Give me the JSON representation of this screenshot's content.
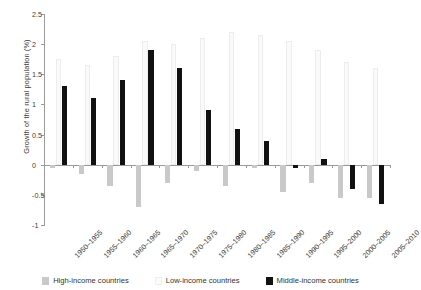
{
  "chart_data": {
    "type": "bar",
    "title": "",
    "xlabel": "",
    "ylabel": "Growth of the rural population (%)",
    "ylim": [
      -1,
      2.5
    ],
    "yticks": [
      -1,
      -0.5,
      0,
      0.5,
      1,
      1.5,
      2,
      2.5
    ],
    "ytick_labels": [
      "-1",
      "-0.5",
      "0",
      "0.5",
      "1",
      "1.5",
      "2",
      "2.5"
    ],
    "grid": false,
    "legend_position": "bottom",
    "categories": [
      "1950–1955",
      "1955–1960",
      "1960–1965",
      "1965–1970",
      "1970–1975",
      "1975–1980",
      "1980–1985",
      "1985–1990",
      "1990–1995",
      "1995–2000",
      "2000–2005",
      "2005–2010"
    ],
    "series": [
      {
        "name": "High-income countries",
        "color": "#c9c9c9",
        "values": [
          -0.05,
          -0.15,
          -0.35,
          -0.7,
          -0.3,
          -0.1,
          -0.35,
          -0.05,
          -0.45,
          -0.3,
          -0.55,
          -0.55
        ]
      },
      {
        "name": "Low-income countries",
        "color": "#fafafa",
        "values": [
          1.75,
          1.65,
          1.8,
          2.05,
          2.0,
          2.1,
          2.2,
          2.15,
          2.05,
          1.9,
          1.7,
          1.6
        ]
      },
      {
        "name": "Middle-income countries",
        "color": "#111111",
        "values": [
          1.3,
          1.1,
          1.4,
          1.9,
          1.6,
          0.9,
          0.6,
          0.4,
          -0.05,
          0.1,
          -0.4,
          -0.65
        ]
      }
    ]
  },
  "legend": {
    "items": [
      {
        "label": "High-income countries",
        "key": "s-high"
      },
      {
        "label": "Low-income countries",
        "key": "s-low"
      },
      {
        "label": "Middle-income countries",
        "key": "s-mid"
      }
    ]
  }
}
